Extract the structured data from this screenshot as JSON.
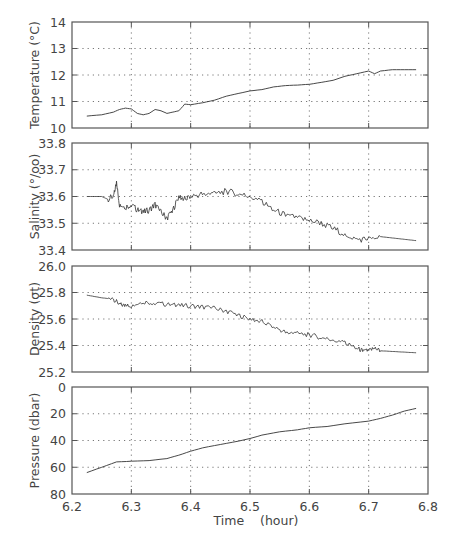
{
  "figure": {
    "xlabel": "Time    (hour)",
    "xticks": [
      "6.2",
      "6.3",
      "6.4",
      "6.5",
      "6.6",
      "6.7",
      "6.8"
    ],
    "xlim": [
      6.2,
      6.8
    ],
    "colors": {
      "frame": "#555555",
      "grid": "#777777",
      "line": "#333333",
      "text": "#444444"
    }
  },
  "chart_data": [
    {
      "type": "line",
      "title": "",
      "ylabel": "Temperature  (°C)",
      "xlabel": "",
      "ylim": [
        10,
        14
      ],
      "yticks": [
        "14",
        "13",
        "12",
        "11",
        "10"
      ],
      "grid": true,
      "x": [
        6.225,
        6.25,
        6.27,
        6.28,
        6.29,
        6.3,
        6.31,
        6.32,
        6.33,
        6.34,
        6.35,
        6.36,
        6.37,
        6.38,
        6.39,
        6.4,
        6.42,
        6.44,
        6.46,
        6.48,
        6.5,
        6.52,
        6.54,
        6.56,
        6.58,
        6.6,
        6.62,
        6.64,
        6.66,
        6.68,
        6.7,
        6.71,
        6.72,
        6.74,
        6.76,
        6.78
      ],
      "values": [
        10.45,
        10.5,
        10.6,
        10.7,
        10.75,
        10.72,
        10.55,
        10.5,
        10.55,
        10.7,
        10.65,
        10.55,
        10.6,
        10.65,
        10.9,
        10.88,
        10.95,
        11.05,
        11.2,
        11.3,
        11.4,
        11.45,
        11.55,
        11.6,
        11.62,
        11.65,
        11.72,
        11.8,
        11.95,
        12.05,
        12.15,
        12.05,
        12.15,
        12.2,
        12.2,
        12.2
      ]
    },
    {
      "type": "line",
      "title": "",
      "ylabel": "Salinity  (°/oo)",
      "xlabel": "",
      "ylim": [
        33.4,
        33.8
      ],
      "yticks": [
        "33.8",
        "33.7",
        "33.6",
        "33.5",
        "33.4"
      ],
      "grid": true,
      "x": [
        6.225,
        6.25,
        6.26,
        6.27,
        6.275,
        6.28,
        6.29,
        6.3,
        6.31,
        6.32,
        6.33,
        6.34,
        6.35,
        6.36,
        6.37,
        6.38,
        6.39,
        6.4,
        6.42,
        6.44,
        6.46,
        6.48,
        6.5,
        6.52,
        6.54,
        6.56,
        6.58,
        6.6,
        6.62,
        6.64,
        6.66,
        6.68,
        6.7,
        6.72,
        6.74,
        6.76,
        6.78
      ],
      "values": [
        33.6,
        33.6,
        33.59,
        33.6,
        33.65,
        33.57,
        33.56,
        33.57,
        33.55,
        33.54,
        33.55,
        33.57,
        33.54,
        33.52,
        33.55,
        33.6,
        33.59,
        33.6,
        33.61,
        33.61,
        33.62,
        33.61,
        33.6,
        33.58,
        33.55,
        33.53,
        33.52,
        33.51,
        33.5,
        33.48,
        33.46,
        33.44,
        33.44,
        33.45,
        33.445,
        33.44,
        33.435
      ]
    },
    {
      "type": "line",
      "title": "",
      "ylabel": "Density  (σt)",
      "xlabel": "",
      "ylim": [
        25.2,
        26.0
      ],
      "yticks": [
        "26.0",
        "25.8",
        "25.6",
        "25.4",
        "25.2"
      ],
      "grid": true,
      "x": [
        6.225,
        6.25,
        6.27,
        6.28,
        6.29,
        6.3,
        6.32,
        6.34,
        6.36,
        6.38,
        6.4,
        6.42,
        6.44,
        6.46,
        6.48,
        6.5,
        6.52,
        6.54,
        6.56,
        6.58,
        6.6,
        6.62,
        6.64,
        6.66,
        6.68,
        6.69,
        6.7,
        6.71,
        6.72,
        6.74,
        6.76,
        6.78
      ],
      "values": [
        25.78,
        25.76,
        25.75,
        25.71,
        25.7,
        25.7,
        25.73,
        25.72,
        25.71,
        25.7,
        25.7,
        25.69,
        25.68,
        25.66,
        25.63,
        25.6,
        25.58,
        25.54,
        25.5,
        25.49,
        25.48,
        25.46,
        25.44,
        25.42,
        25.38,
        25.36,
        25.36,
        25.38,
        25.36,
        25.355,
        25.35,
        25.345
      ]
    },
    {
      "type": "line",
      "title": "",
      "ylabel": "Pressure  (dbar)",
      "xlabel": "Time    (hour)",
      "ylim": [
        80,
        0
      ],
      "yticks": [
        "0",
        "20",
        "40",
        "60",
        "80"
      ],
      "grid": true,
      "x": [
        6.225,
        6.25,
        6.275,
        6.3,
        6.33,
        6.36,
        6.38,
        6.4,
        6.42,
        6.45,
        6.48,
        6.5,
        6.52,
        6.55,
        6.58,
        6.6,
        6.63,
        6.66,
        6.7,
        6.72,
        6.74,
        6.76,
        6.78
      ],
      "values": [
        64,
        60,
        56,
        55.5,
        55,
        53.5,
        51,
        48,
        45.5,
        43,
        40.5,
        38.5,
        36,
        33.5,
        32,
        30.5,
        29.5,
        27.5,
        25.5,
        23.5,
        21,
        18,
        16
      ]
    }
  ]
}
